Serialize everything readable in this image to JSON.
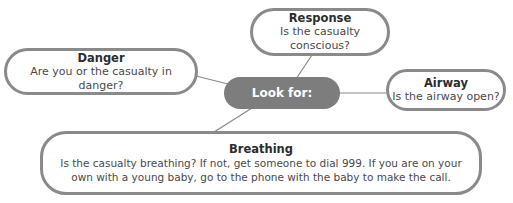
{
  "diagram": {
    "center": {
      "label": "Look for:"
    },
    "nodes": [
      {
        "id": "response",
        "title": "Response",
        "description": "Is the casualty conscious?"
      },
      {
        "id": "danger",
        "title": "Danger",
        "description": "Are you or the casualty in danger?"
      },
      {
        "id": "airway",
        "title": "Airway",
        "description": "Is the airway open?"
      },
      {
        "id": "breathing",
        "title": "Breathing",
        "description": "Is the casualty breathing? If not, get someone to dial 999. If you are on your own with a young baby, go to the phone with the baby to make the call."
      }
    ],
    "colors": {
      "border": "#8a8a8a",
      "center_fill": "#7d7d7d",
      "center_text": "#ffffff",
      "text": "#3a3a3a"
    }
  }
}
